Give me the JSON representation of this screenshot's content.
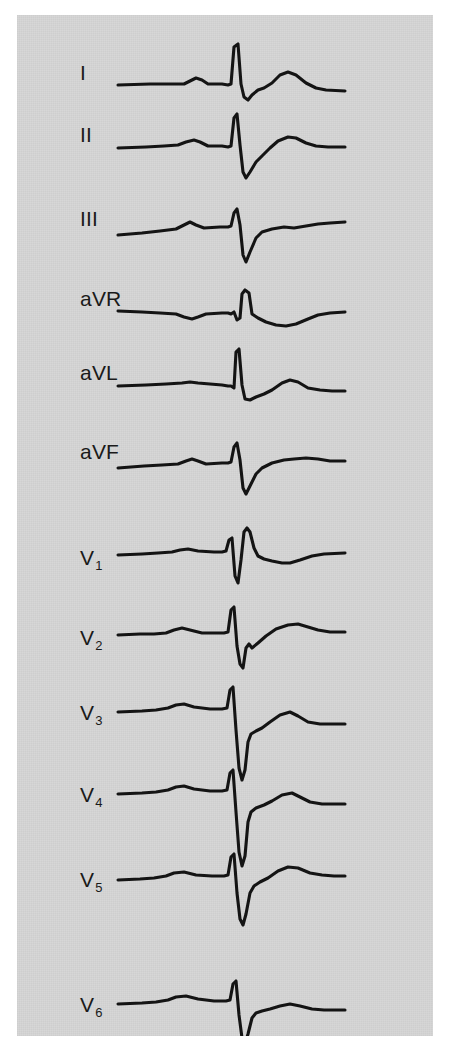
{
  "figure": {
    "kind": "12-lead-electrocardiogram",
    "background_color": "#ffffff",
    "panel_color": "#d6d6d6",
    "trace_color": "#141414",
    "panel": {
      "x": 17,
      "y": 15,
      "width": 416,
      "height": 1021
    }
  },
  "chart_data": {
    "type": "line",
    "title": "",
    "subtitle": "",
    "xlabel": "",
    "ylabel": "",
    "grid": false,
    "legend_position": "left",
    "axis_note": "Time along x; amplitude along y. No calibration grid or scale markings printed.",
    "lead_count": 12,
    "leads": [
      {
        "name": "I",
        "label_main": "I",
        "label_sub": "",
        "label_x": 80,
        "label_y": 62,
        "baseline_y": 85,
        "morphology": "small P wave, tall narrow R wave, small s, low broad T wave",
        "points": "118,85 150,84 168,84 184,84 190,81 196,78 202,80 208,84 222,84 228,85 231,84 234,47 238,44 241,84 244,97 248,100 252,95 258,90 264,88 272,83 280,75 288,72 296,75 306,83 316,88 326,90 345,91"
      },
      {
        "name": "II",
        "label_main": "II",
        "label_sub": "",
        "label_x": 80,
        "label_y": 124,
        "baseline_y": 147,
        "morphology": "P wave, tall R wave with deep S wave, upright T wave",
        "points": "118,148 146,147 164,146 178,145 186,142 194,140 200,142 208,146 222,146 228,147 231,146 234,118 237,114 240,145 243,172 246,178 250,172 256,162 262,156 270,148 278,141 288,137 296,138 306,143 316,146 328,147 345,147"
      },
      {
        "name": "III",
        "label_main": "III",
        "label_sub": "",
        "label_x": 80,
        "label_y": 208,
        "baseline_y": 232,
        "morphology": "small P, small r with very deep S wave, flat T wave",
        "points": "118,235 142,233 160,231 176,229 184,225 190,222 196,225 204,228 220,227 228,227 231,226 234,213 237,209 240,225 243,255 246,262 250,252 256,238 262,232 272,229 284,227 294,228 306,226 318,224 330,223 345,222"
      },
      {
        "name": "aVR",
        "label_main": "aVR",
        "label_sub": "",
        "label_x": 80,
        "label_y": 288,
        "baseline_y": 311,
        "morphology": "inverted P wave, positive R wave, inverted T wave",
        "points": "118,311 142,312 160,313 176,314 184,317 192,319 198,317 206,314 222,313 228,313 231,314 234,312 237,320 240,318 242,294 245,290 249,293 252,314 258,318 266,322 276,325 286,326 296,324 308,319 318,315 330,313 345,312"
      },
      {
        "name": "aVL",
        "label_main": "aVL",
        "label_sub": "",
        "label_x": 80,
        "label_y": 362,
        "baseline_y": 385,
        "morphology": "flat P, tall R wave, small s, low rounded T wave",
        "points": "118,386 146,385 166,384 182,383 190,382 198,383 210,384 222,385 228,386 231,386 234,388 236,352 239,349 242,385 245,399 250,400 256,397 264,394 272,390 282,383 290,380 298,382 308,388 320,390 332,391 345,391"
      },
      {
        "name": "aVF",
        "label_main": "aVF",
        "label_sub": "",
        "label_x": 80,
        "label_y": 441,
        "baseline_y": 465,
        "morphology": "P wave, small r with deep S wave, flat-to-upright T wave",
        "points": "118,468 144,466 162,465 178,464 186,461 192,459 198,461 206,464 222,463 228,463 231,462 234,447 237,443 240,460 243,488 246,494 250,486 256,474 262,468 272,463 284,460 294,459 306,458 318,459 330,461 345,461"
      },
      {
        "name": "V1",
        "label_main": "V",
        "label_sub": "1",
        "label_x": 80,
        "label_y": 547,
        "baseline_y": 553,
        "morphology": "rSR' pattern: small r, deep S, tall R prime, shallow negative T",
        "points": "118,555 142,554 158,553 172,552 180,550 188,549 198,551 214,552 222,552 226,551 229,540 232,538 235,576 238,583 241,560 244,532 247,528 250,532 254,548 258,556 264,559 272,561 282,563 290,563 300,560 312,556 324,554 345,553"
      },
      {
        "name": "V2",
        "label_main": "V",
        "label_sub": "2",
        "label_x": 80,
        "label_y": 627,
        "baseline_y": 633,
        "morphology": "tall R wave with very deep S wave, notched J point, upright T wave",
        "points": "118,635 140,634 154,634 166,633 174,630 182,628 190,630 202,633 216,633 224,633 228,632 231,610 234,607 237,646 240,664 243,668 246,648 249,644 252,648 258,643 266,636 276,629 288,625 298,624 308,627 318,630 330,632 345,632"
      },
      {
        "name": "V3",
        "label_main": "V",
        "label_sub": "3",
        "label_x": 80,
        "label_y": 702,
        "baseline_y": 708,
        "morphology": "tall R wave with very deep S wave extending below the row, upright T wave",
        "points": "118,712 142,711 156,710 168,708 176,705 184,704 194,707 210,709 222,709 227,708 230,690 233,687 236,730 239,768 242,780 245,770 248,742 251,734 256,731 262,728 270,722 280,715 290,712 298,716 308,722 320,724 332,724 345,724"
      },
      {
        "name": "V4",
        "label_main": "V",
        "label_sub": "4",
        "label_x": 80,
        "label_y": 784,
        "baseline_y": 790,
        "morphology": "R wave with very deep S wave extending below the row, upright T wave",
        "points": "118,794 142,793 156,792 168,790 176,787 184,786 194,789 210,791 222,791 227,790 230,773 233,770 236,812 239,852 242,866 245,856 248,822 251,812 256,808 264,805 272,801 282,795 292,793 300,797 310,802 322,804 334,804 345,804"
      },
      {
        "name": "V5",
        "label_main": "V",
        "label_sub": "5",
        "label_x": 80,
        "label_y": 869,
        "baseline_y": 875,
        "morphology": "R wave with deep S wave, upright T wave",
        "points": "118,880 140,879 154,878 166,876 174,873 184,872 196,875 212,876 224,876 228,875 231,857 234,854 237,893 240,919 243,925 246,914 250,893 254,886 260,882 268,878 278,871 288,867 298,868 310,873 322,875 334,876 345,876"
      },
      {
        "name": "V6",
        "label_main": "V",
        "label_sub": "6",
        "label_x": 80,
        "label_y": 994,
        "baseline_y": 1000,
        "morphology": "R wave with deep S wave, small upright T wave",
        "points": "118,1004 142,1003 156,1002 168,1000 176,997 186,996 198,999 214,1001 226,1001 230,1000 233,984 236,981 239,1015 242,1038 245,1044 248,1034 252,1018 256,1013 262,1011 270,1009 280,1006 290,1004 300,1006 312,1009 324,1010 334,1010 345,1010"
      }
    ]
  }
}
